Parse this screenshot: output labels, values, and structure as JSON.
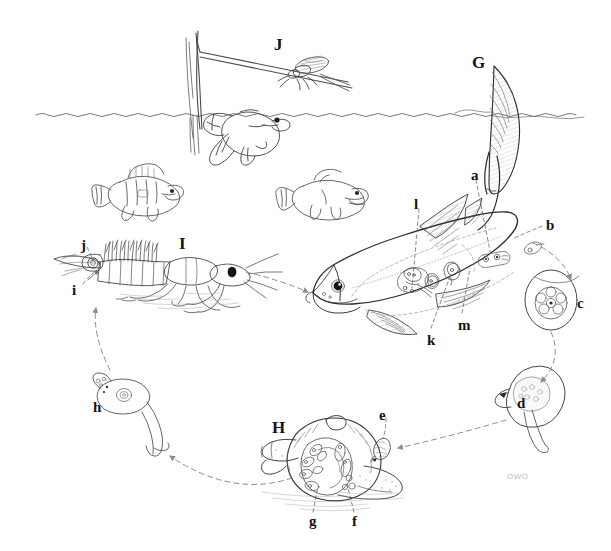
{
  "figure": {
    "background_color": "#ffffff",
    "ink_color": "#2b2b2b",
    "light_ink_color": "#8c8c8c",
    "width": 611,
    "height": 551
  },
  "signature": {
    "text": "OWO",
    "x": 507,
    "y": 472
  },
  "host_labels": [
    {
      "id": "G",
      "text": "G",
      "x": 472,
      "y": 54,
      "description": "large definitive-host fish"
    },
    {
      "id": "H",
      "text": "H",
      "x": 272,
      "y": 419,
      "description": "snail intermediate host"
    },
    {
      "id": "I",
      "text": "I",
      "x": 179,
      "y": 235,
      "description": "crayfish intermediate host"
    },
    {
      "id": "J",
      "text": "J",
      "x": 274,
      "y": 36,
      "description": "adult insect / mayfly above water"
    }
  ],
  "stage_labels": [
    {
      "id": "a",
      "text": "a",
      "x": 471,
      "y": 168,
      "description": "adult worm in fish"
    },
    {
      "id": "b",
      "text": "b",
      "x": 546,
      "y": 218,
      "description": "egg release point"
    },
    {
      "id": "c",
      "text": "c",
      "x": 577,
      "y": 296,
      "description": "embryonated egg"
    },
    {
      "id": "d",
      "text": "d",
      "x": 517,
      "y": 396,
      "description": "miracidium / free-swimming larva"
    },
    {
      "id": "e",
      "text": "e",
      "x": 379,
      "y": 408,
      "description": "larva penetrating snail"
    },
    {
      "id": "f",
      "text": "f",
      "x": 352,
      "y": 514,
      "description": "daughter stage in snail"
    },
    {
      "id": "g",
      "text": "g",
      "x": 309,
      "y": 514,
      "description": "sporocyst / redia in snail"
    },
    {
      "id": "h",
      "text": "h",
      "x": 93,
      "y": 400,
      "description": "cercaria free-swimming stage"
    },
    {
      "id": "i",
      "text": "i",
      "x": 72,
      "y": 283,
      "description": "penetration site on crayfish"
    },
    {
      "id": "j",
      "text": "j",
      "x": 81,
      "y": 238,
      "description": "metacercaria encysted in crayfish"
    },
    {
      "id": "k",
      "text": "k",
      "x": 427,
      "y": 333,
      "description": "juvenile worm in fish viscera"
    },
    {
      "id": "l",
      "text": "l",
      "x": 414,
      "y": 197,
      "description": "worm migrating in fish"
    },
    {
      "id": "m",
      "text": "m",
      "x": 458,
      "y": 318,
      "description": "worm in fish body cavity"
    }
  ],
  "scene_elements": [
    {
      "name": "water-surface-line",
      "description": "wavy waterline across upper third"
    },
    {
      "name": "fishing-rod",
      "description": "rod with line angling down into water"
    },
    {
      "name": "mayfly-lure",
      "description": "winged insect on the line"
    },
    {
      "name": "hooked-fish",
      "description": "fish rising to the lure at the surface"
    },
    {
      "name": "perch-fish",
      "description": "small barred perch swimming mid-left"
    },
    {
      "name": "bass-fish",
      "description": "small bass swimming mid-centre"
    },
    {
      "name": "definitive-host-fish",
      "description": "large fish showing internal parasites"
    },
    {
      "name": "crayfish",
      "description": "crayfish on the bottom, left"
    },
    {
      "name": "snail",
      "description": "sectioned snail on the bottom, centre"
    },
    {
      "name": "egg",
      "description": "oval egg with internal cell mass"
    },
    {
      "name": "miracidium",
      "description": "ciliated swimming larva"
    },
    {
      "name": "cercaria",
      "description": "tailed swimming larva"
    }
  ],
  "cycle_arrows": [
    {
      "from": "b",
      "to": "c",
      "style": "dashed"
    },
    {
      "from": "c",
      "to": "d",
      "style": "dashed"
    },
    {
      "from": "d",
      "to": "e",
      "style": "dashed"
    },
    {
      "from": "snail",
      "to": "cercaria",
      "style": "dashed"
    },
    {
      "from": "cercaria",
      "to": "crayfish",
      "style": "dashed"
    },
    {
      "from": "crayfish",
      "to": "definitive-host-fish",
      "style": "dashed"
    }
  ]
}
